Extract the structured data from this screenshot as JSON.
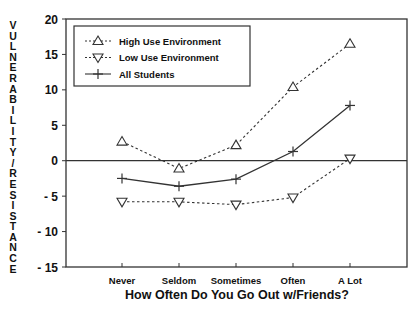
{
  "chart_data": {
    "type": "line",
    "title": "",
    "xlabel": "How Often Do You Go Out w/Friends?",
    "ylabel": "VULNERABILITY/RESISTANCE",
    "categories": [
      "Never",
      "Seldom",
      "Sometimes",
      "Often",
      "A Lot"
    ],
    "ylim": [
      -15,
      20
    ],
    "yticks": [
      20,
      15,
      10,
      5,
      0,
      -5,
      -10,
      -15
    ],
    "grid": false,
    "zero_line": true,
    "legend_position": "upper left",
    "series": [
      {
        "name": "High Use Environment",
        "marker": "triangle-up",
        "line": "dotted",
        "values": [
          2.7,
          -1.1,
          2.2,
          10.4,
          16.5
        ]
      },
      {
        "name": "Low Use Environment",
        "marker": "triangle-down",
        "line": "dotted",
        "values": [
          -5.8,
          -5.8,
          -6.2,
          -5.2,
          0.3
        ]
      },
      {
        "name": "All Students",
        "marker": "plus",
        "line": "solid",
        "values": [
          -2.5,
          -3.6,
          -2.6,
          1.3,
          7.8
        ]
      }
    ]
  }
}
